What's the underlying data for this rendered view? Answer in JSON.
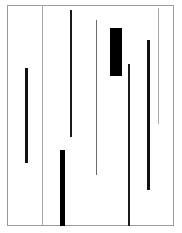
{
  "figure": {
    "type": "abstract-vertical-segments",
    "canvas": {
      "width": 182,
      "height": 233,
      "background": "#ffffff"
    },
    "frame": {
      "name": "plot-frame",
      "x": 7,
      "y": 5,
      "width": 167,
      "height": 221,
      "border_width": 1,
      "border_color": "#9a9a9a"
    },
    "dividers": [
      {
        "name": "divider-left",
        "x": 42,
        "y": 5,
        "width": 1,
        "height": 221,
        "color": "#a8a8a8"
      },
      {
        "name": "divider-right",
        "x": 158,
        "y": 8,
        "width": 1,
        "height": 116,
        "color": "#a8a8a8"
      }
    ],
    "segments": [
      {
        "name": "segment-1",
        "x": 25,
        "y": 68,
        "width": 3,
        "height": 95,
        "color": "#111111",
        "weight": "thick"
      },
      {
        "name": "segment-2",
        "x": 60,
        "y": 150,
        "width": 5,
        "height": 76,
        "color": "#000000",
        "weight": "extra-thick"
      },
      {
        "name": "segment-3",
        "x": 70,
        "y": 10,
        "width": 2,
        "height": 127,
        "color": "#1a1a1a",
        "weight": "medium"
      },
      {
        "name": "segment-4",
        "x": 96,
        "y": 20,
        "width": 1,
        "height": 155,
        "color": "#6b6b6b",
        "weight": "thin"
      },
      {
        "name": "segment-5",
        "x": 110,
        "y": 28,
        "width": 12,
        "height": 48,
        "color": "#000000",
        "weight": "bar"
      },
      {
        "name": "segment-6",
        "x": 128,
        "y": 64,
        "width": 2,
        "height": 162,
        "color": "#1a1a1a",
        "weight": "medium"
      },
      {
        "name": "segment-7",
        "x": 147,
        "y": 40,
        "width": 3,
        "height": 150,
        "color": "#111111",
        "weight": "thick"
      }
    ]
  }
}
